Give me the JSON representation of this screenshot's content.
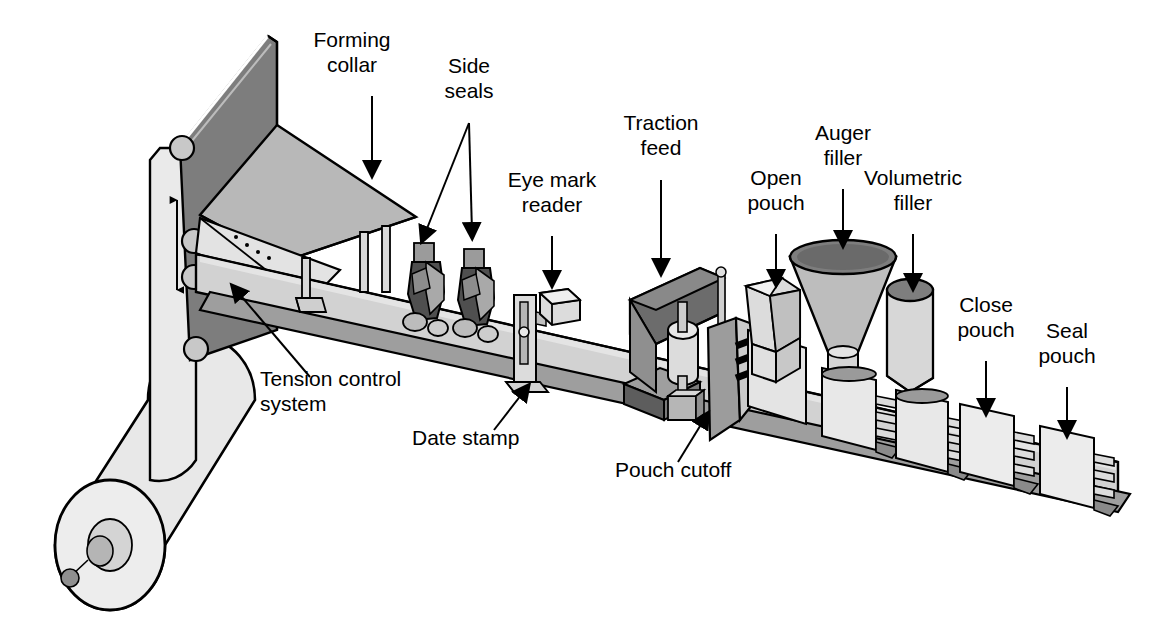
{
  "diagram": {
    "type": "technical-line-drawing",
    "background": "#ffffff",
    "palette": {
      "outline": "#000000",
      "light_face": "#e8e8e8",
      "mid_face": "#c9c9c9",
      "dark_face": "#8a8a8a",
      "darkest_face": "#6e6e6e",
      "belt_face": "#bdbdbd",
      "white_face": "#f5f5f5"
    },
    "labels": [
      {
        "id": "forming-collar",
        "text_lines": [
          "Forming",
          "collar"
        ],
        "x": 352,
        "y": 47,
        "arrow": {
          "x1": 372,
          "y1": 96,
          "x2": 372,
          "y2": 170
        }
      },
      {
        "id": "side-seals",
        "text_lines": [
          "Side",
          "seals"
        ],
        "x": 469,
        "y": 73,
        "arrow": {
          "x1": 469,
          "y1": 123,
          "x2": 424,
          "y2": 236
        },
        "arrow2": {
          "x1": 469,
          "y1": 123,
          "x2": 472,
          "y2": 232
        }
      },
      {
        "id": "eye-mark-reader",
        "text_lines": [
          "Eye mark",
          "reader"
        ],
        "x": 552,
        "y": 187,
        "arrow": {
          "x1": 552,
          "y1": 236,
          "x2": 552,
          "y2": 280
        }
      },
      {
        "id": "traction-feed",
        "text_lines": [
          "Traction",
          "feed"
        ],
        "x": 661,
        "y": 130,
        "arrow": {
          "x1": 661,
          "y1": 180,
          "x2": 661,
          "y2": 268
        }
      },
      {
        "id": "open-pouch",
        "text_lines": [
          "Open",
          "pouch"
        ],
        "x": 776,
        "y": 185,
        "arrow": {
          "x1": 776,
          "y1": 234,
          "x2": 776,
          "y2": 279
        }
      },
      {
        "id": "auger-filler",
        "text_lines": [
          "Auger",
          "filler"
        ],
        "x": 843,
        "y": 140,
        "arrow": {
          "x1": 843,
          "y1": 189,
          "x2": 843,
          "y2": 240
        }
      },
      {
        "id": "volumetric-filler",
        "text_lines": [
          "Volumetric",
          "filler"
        ],
        "x": 913,
        "y": 185,
        "arrow": {
          "x1": 913,
          "y1": 234,
          "x2": 913,
          "y2": 283
        }
      },
      {
        "id": "close-pouch",
        "text_lines": [
          "Close",
          "pouch"
        ],
        "x": 986,
        "y": 312,
        "arrow": {
          "x1": 986,
          "y1": 361,
          "x2": 986,
          "y2": 408
        }
      },
      {
        "id": "seal-pouch",
        "text_lines": [
          "Seal",
          "pouch"
        ],
        "x": 1067,
        "y": 338,
        "arrow": {
          "x1": 1067,
          "y1": 387,
          "x2": 1067,
          "y2": 430
        }
      },
      {
        "id": "tension-control",
        "text_lines": [
          "Tension control",
          "system"
        ],
        "x": 260,
        "y": 386,
        "align": "start",
        "arrow": {
          "x1": 310,
          "y1": 377,
          "x2": 236,
          "y2": 290
        }
      },
      {
        "id": "date-stamp",
        "text_lines": [
          "Date stamp"
        ],
        "x": 412,
        "y": 445,
        "align": "start",
        "arrow": {
          "x1": 494,
          "y1": 430,
          "x2": 525,
          "y2": 390
        }
      },
      {
        "id": "pouch-cutoff",
        "text_lines": [
          "Pouch cutoff"
        ],
        "x": 615,
        "y": 477,
        "align": "start",
        "arrow": {
          "x1": 678,
          "y1": 462,
          "x2": 705,
          "y2": 418
        }
      }
    ],
    "components": [
      {
        "id": "film-roll",
        "name": "Film supply roll"
      },
      {
        "id": "film-web",
        "name": "Film web"
      },
      {
        "id": "tension-rollers",
        "name": "Tension control rollers"
      },
      {
        "id": "forming-collar",
        "name": "Forming collar"
      },
      {
        "id": "conveyor",
        "name": "Conveyor track"
      },
      {
        "id": "side-seal-1",
        "name": "Side seal station 1"
      },
      {
        "id": "side-seal-2",
        "name": "Side seal station 2"
      },
      {
        "id": "date-stamp-unit",
        "name": "Date stamp unit"
      },
      {
        "id": "eye-mark-sensor",
        "name": "Eye mark reader sensor"
      },
      {
        "id": "traction-feed-unit",
        "name": "Traction feed drive"
      },
      {
        "id": "cutoff-blade",
        "name": "Pouch cutoff blade"
      },
      {
        "id": "open-pouch-unit",
        "name": "Pouch opening device"
      },
      {
        "id": "auger-filler-unit",
        "name": "Auger filler hopper"
      },
      {
        "id": "volumetric-unit",
        "name": "Volumetric filler cylinder"
      },
      {
        "id": "close-pouch-unit",
        "name": "Pouch closing station"
      },
      {
        "id": "seal-pouch-unit",
        "name": "Pouch sealing station"
      }
    ]
  }
}
